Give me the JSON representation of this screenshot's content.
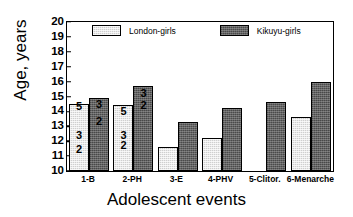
{
  "chart_data": {
    "type": "bar",
    "title": "",
    "xlabel": "Adolescent events",
    "ylabel": "Age, years",
    "ylim": [
      10,
      20
    ],
    "yticks": [
      10,
      11,
      12,
      13,
      14,
      15,
      16,
      17,
      18,
      19,
      20
    ],
    "grid": false,
    "legend_position": "top-inside",
    "categories": [
      "1-B",
      "2-PH",
      "3-E",
      "4-PHV",
      "5-Clitor.",
      "6-Menarche"
    ],
    "series": [
      {
        "name": "London-girls",
        "color": "#cfcfcf",
        "values": [
          14.5,
          14.4,
          11.6,
          12.2,
          null,
          13.6
        ]
      },
      {
        "name": "Kikuyu-girls",
        "color": "#626262",
        "values": [
          14.9,
          15.7,
          13.3,
          14.2,
          14.6,
          16.0
        ]
      }
    ],
    "bar_annotations": [
      {
        "category": "1-B",
        "series": "London-girls",
        "labels": [
          {
            "text": "5",
            "value": 14.45
          },
          {
            "text": "3",
            "value": 12.45
          },
          {
            "text": "2",
            "value": 11.45
          }
        ]
      },
      {
        "category": "1-B",
        "series": "Kikuyu-girls",
        "labels": [
          {
            "text": "3",
            "value": 14.55
          },
          {
            "text": "2",
            "value": 13.4
          }
        ]
      },
      {
        "category": "2-PH",
        "series": "London-girls",
        "labels": [
          {
            "text": "5",
            "value": 14.1
          },
          {
            "text": "3",
            "value": 12.45
          },
          {
            "text": "2",
            "value": 11.75
          }
        ]
      },
      {
        "category": "2-PH",
        "series": "Kikuyu-girls",
        "labels": [
          {
            "text": "3",
            "value": 15.3
          },
          {
            "text": "2",
            "value": 14.5
          }
        ]
      }
    ]
  }
}
